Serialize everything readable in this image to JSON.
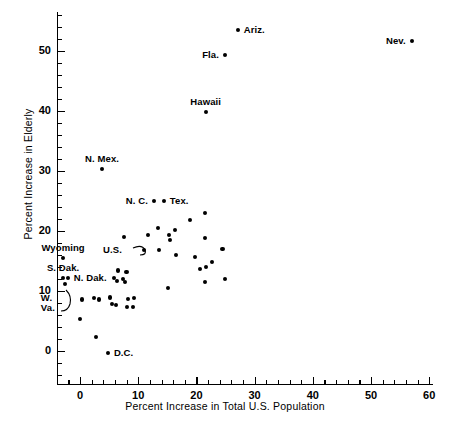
{
  "chart_data": {
    "type": "scatter",
    "title": "",
    "xlabel": "Percent Increase in Total U.S. Population",
    "ylabel": "Percent Increase in Elderly",
    "xlim": [
      -5,
      61
    ],
    "ylim": [
      -3,
      57
    ],
    "xticks": [
      0,
      10,
      20,
      30,
      40,
      50,
      60
    ],
    "xtick_labels": [
      "0",
      "10",
      "20",
      "30",
      "40",
      "50",
      "60"
    ],
    "yticks": [
      0,
      10,
      20,
      30,
      40,
      50
    ],
    "ytick_labels": [
      "0",
      "10",
      "20",
      "30",
      "40",
      "50"
    ],
    "minor_tick_step_x": 2,
    "minor_tick_step_y": 2,
    "grid": false,
    "legend": null,
    "marker": "filled-circle",
    "marker_color": "#000000",
    "points": [
      {
        "label": "Ariz.",
        "x": 27.1,
        "y": 53.5,
        "label_pos": "right"
      },
      {
        "label": "Nev.",
        "x": 57.0,
        "y": 51.7,
        "label_pos": "left"
      },
      {
        "label": "Fla.",
        "x": 24.9,
        "y": 49.3,
        "label_pos": "left"
      },
      {
        "label": "Hawaii",
        "x": 21.6,
        "y": 39.8,
        "label_pos": "above"
      },
      {
        "label": "N. Mex.",
        "x": 3.8,
        "y": 30.3,
        "label_pos": "above"
      },
      {
        "label": "Tex.",
        "x": 14.4,
        "y": 25.0,
        "label_pos": "right"
      },
      {
        "label": "N. C.",
        "x": 12.7,
        "y": 25.0,
        "label_pos": "left"
      },
      {
        "label": "U.S.",
        "x": 11.0,
        "y": 16.8,
        "label_pos": "leader-left"
      },
      {
        "label": "Wyoming",
        "x": -2.9,
        "y": 15.5,
        "label_pos": "above"
      },
      {
        "label": "S. Dak.",
        "x": -2.9,
        "y": 12.2,
        "label_pos": "above"
      },
      {
        "label": "N. Dak.",
        "x": -2.1,
        "y": 12.2,
        "label_pos": "right"
      },
      {
        "label": "W. Va.",
        "x": -2.6,
        "y": 11.2,
        "label_pos": "leader-below"
      },
      {
        "label": "D.C.",
        "x": 4.8,
        "y": -0.3,
        "label_pos": "right"
      },
      {
        "label": "",
        "x": 21.5,
        "y": 23.0
      },
      {
        "label": "",
        "x": 18.9,
        "y": 21.8
      },
      {
        "label": "",
        "x": 21.5,
        "y": 18.8
      },
      {
        "label": "",
        "x": 16.3,
        "y": 20.2
      },
      {
        "label": "",
        "x": 15.3,
        "y": 19.3
      },
      {
        "label": "",
        "x": 15.5,
        "y": 18.5
      },
      {
        "label": "",
        "x": 13.4,
        "y": 20.5
      },
      {
        "label": "",
        "x": 11.7,
        "y": 19.3
      },
      {
        "label": "",
        "x": 7.6,
        "y": 19.0
      },
      {
        "label": "",
        "x": 13.6,
        "y": 16.8
      },
      {
        "label": "",
        "x": 16.5,
        "y": 16.0
      },
      {
        "label": "",
        "x": 19.8,
        "y": 15.7
      },
      {
        "label": "",
        "x": 22.7,
        "y": 14.8
      },
      {
        "label": "",
        "x": 24.5,
        "y": 17.0
      },
      {
        "label": "",
        "x": 20.6,
        "y": 13.7
      },
      {
        "label": "",
        "x": 21.6,
        "y": 14.0
      },
      {
        "label": "",
        "x": 24.9,
        "y": 12.0
      },
      {
        "label": "",
        "x": 6.5,
        "y": 13.4
      },
      {
        "label": "",
        "x": 8.0,
        "y": 13.2
      },
      {
        "label": "",
        "x": 5.8,
        "y": 12.2
      },
      {
        "label": "",
        "x": 7.4,
        "y": 12.0
      },
      {
        "label": "",
        "x": 6.4,
        "y": 11.7
      },
      {
        "label": "",
        "x": 7.7,
        "y": 11.5
      },
      {
        "label": "",
        "x": 15.1,
        "y": 10.5
      },
      {
        "label": "",
        "x": 0.3,
        "y": 8.6
      },
      {
        "label": "",
        "x": 2.4,
        "y": 8.8
      },
      {
        "label": "",
        "x": 3.3,
        "y": 8.6
      },
      {
        "label": "",
        "x": 5.2,
        "y": 8.9
      },
      {
        "label": "",
        "x": 5.5,
        "y": 7.8
      },
      {
        "label": "",
        "x": 6.2,
        "y": 7.7
      },
      {
        "label": "",
        "x": 8.2,
        "y": 8.7
      },
      {
        "label": "",
        "x": 9.3,
        "y": 8.8
      },
      {
        "label": "",
        "x": 8.1,
        "y": 7.3
      },
      {
        "label": "",
        "x": 9.1,
        "y": 7.3
      },
      {
        "label": "",
        "x": 21.5,
        "y": 11.5
      },
      {
        "label": "",
        "x": 0.0,
        "y": 5.3
      },
      {
        "label": "",
        "x": 2.7,
        "y": 2.3
      }
    ]
  }
}
